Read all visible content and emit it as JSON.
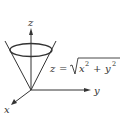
{
  "figure": {
    "axes": {
      "x_label": "x",
      "y_label": "y",
      "z_label": "z"
    },
    "equation": {
      "lhs": "z",
      "equals": "=",
      "radicand_x": "x",
      "exp_x": "2",
      "plus": "+",
      "radicand_y": "y",
      "exp_y": "2"
    },
    "colors": {
      "line": "#333333",
      "background": "#ffffff"
    }
  }
}
